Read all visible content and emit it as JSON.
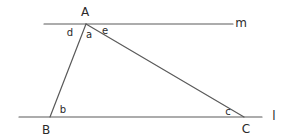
{
  "diagram": {
    "lines": [
      {
        "name": "m",
        "label": "m",
        "x1": 44,
        "y1": 24,
        "x2": 233,
        "y2": 24,
        "label_x": 241,
        "label_y": 23
      },
      {
        "name": "l",
        "label": "l",
        "x1": 19,
        "y1": 117,
        "x2": 262,
        "y2": 117,
        "label_x": 274,
        "label_y": 116
      }
    ],
    "vertices": [
      {
        "name": "A",
        "label": "A",
        "x": 86,
        "y": 24,
        "label_x": 85,
        "label_y": 12
      },
      {
        "name": "B",
        "label": "B",
        "x": 50,
        "y": 117,
        "label_x": 46,
        "label_y": 130
      },
      {
        "name": "C",
        "label": "C",
        "x": 244,
        "y": 117,
        "label_x": 246,
        "label_y": 129
      }
    ],
    "angles": [
      {
        "label": "d",
        "x": 70,
        "y": 33
      },
      {
        "label": "a",
        "x": 89,
        "y": 35
      },
      {
        "label": "e",
        "x": 105,
        "y": 31
      },
      {
        "label": "b",
        "x": 63,
        "y": 110
      },
      {
        "label": "c",
        "x": 228,
        "y": 112
      }
    ],
    "colors": {
      "stroke": "#5a5a5a",
      "text": "#2a2a2a",
      "background": "#ffffff"
    }
  }
}
